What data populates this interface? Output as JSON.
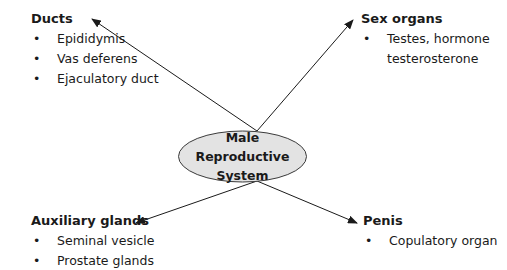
{
  "center": {
    "line1": "Male Reproductive",
    "line2": "System",
    "fill": "#e3e3e3"
  },
  "nodes": {
    "ducts": {
      "title": "Ducts",
      "items": [
        "Epididymis",
        "Vas deferens",
        "Ejaculatory duct"
      ]
    },
    "sex_organs": {
      "title": "Sex organs",
      "items": [
        "Testes, hormone",
        "testerosterone"
      ]
    },
    "auxiliary_glands": {
      "title": "Auxiliary glands",
      "items": [
        "Seminal vesicle",
        "Prostate glands"
      ]
    },
    "penis": {
      "title": "Penis",
      "items": [
        "Copulatory organ"
      ]
    }
  }
}
